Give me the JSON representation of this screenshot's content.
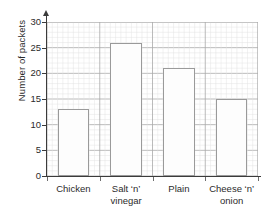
{
  "chart_data": {
    "type": "bar",
    "title": "",
    "xlabel": "",
    "ylabel": "Number of packets",
    "categories": [
      "Chicken",
      "Salt ‘n’ vinegar",
      "Plain",
      "Cheese ‘n’ onion"
    ],
    "category_lines": [
      [
        "Chicken"
      ],
      [
        "Salt ‘n’",
        "vinegar"
      ],
      [
        "Plain"
      ],
      [
        "Cheese ‘n’",
        "onion"
      ]
    ],
    "values": [
      13,
      26,
      21,
      15
    ],
    "ylim": [
      0,
      30
    ],
    "ytick_labels": [
      "0",
      "5",
      "10",
      "15",
      "20",
      "25",
      "30"
    ],
    "ytick_values": [
      0,
      5,
      10,
      15,
      20,
      25,
      30
    ],
    "grid": true,
    "grid_major_step": 5,
    "grid_minor_step": 1,
    "legend": "none",
    "colors": {
      "bar_fill": "#fdfdfd",
      "bar_edge": "#9a9a9a",
      "axis": "#3b3b3b",
      "grid_major": "#a9a9a9",
      "grid_minor": "#e2e2e2",
      "text": "#2b2b2b"
    }
  }
}
